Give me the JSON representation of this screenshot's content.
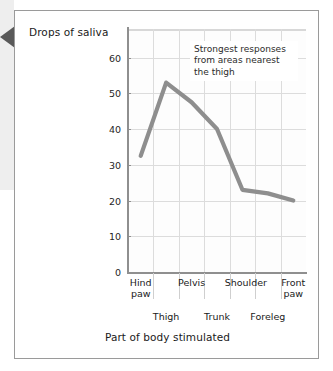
{
  "figure": {
    "left_marker_icon": "left-triangle-marker"
  },
  "chart_data": {
    "type": "line",
    "title": "",
    "ylabel": "Drops of saliva",
    "xlabel": "Part of body stimulated",
    "categories": [
      "Hind paw",
      "Thigh",
      "Pelvis",
      "Trunk",
      "Shoulder",
      "Foreleg",
      "Front paw"
    ],
    "category_rows": [
      {
        "label": "Hind\npaw",
        "row": "top",
        "index": 0
      },
      {
        "label": "Thigh",
        "row": "bottom",
        "index": 1
      },
      {
        "label": "Pelvis",
        "row": "top",
        "index": 2
      },
      {
        "label": "Trunk",
        "row": "bottom",
        "index": 3
      },
      {
        "label": "Shoulder",
        "row": "top",
        "index": 4
      },
      {
        "label": "Foreleg",
        "row": "bottom",
        "index": 5
      },
      {
        "label": "Front\npaw",
        "row": "top",
        "index": 6
      }
    ],
    "values": [
      32.5,
      53,
      47.5,
      40,
      23,
      22,
      20
    ],
    "yticks": [
      0,
      10,
      20,
      30,
      40,
      50,
      60
    ],
    "ylim": [
      0,
      68
    ],
    "grid": true,
    "legend": "none",
    "line_color": "#8e8e8e",
    "grid_color": "#dcdcdc",
    "axis_color": "#8f8f8f",
    "annotations": [
      {
        "text": "Strongest responses from areas nearest the thigh",
        "lines": [
          "Strongest responses",
          "from areas nearest",
          "the thigh"
        ]
      }
    ]
  }
}
